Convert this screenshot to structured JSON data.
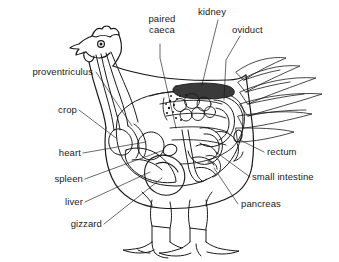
{
  "figure": {
    "background_color": "#ffffff",
    "line_color": "#1a1a1a",
    "kidney_fill": "#3a3a3a",
    "label_color": "#1a1a1a"
  },
  "labels": [
    {
      "id": "paired-caeca",
      "text_line1": "paired",
      "text_line2": "caeca",
      "text": "paired caeca",
      "side": "top",
      "x": 143,
      "y": 18
    },
    {
      "id": "kidney",
      "text": "kidney",
      "side": "top",
      "x": 200,
      "y": 8
    },
    {
      "id": "oviduct",
      "text": "oviduct",
      "side": "top",
      "x": 234,
      "y": 26
    },
    {
      "id": "proventriculus",
      "text": "proventriculus",
      "side": "left",
      "x": 19,
      "y": 69
    },
    {
      "id": "crop",
      "text": "crop",
      "side": "left",
      "x": 58,
      "y": 106
    },
    {
      "id": "heart",
      "text": "heart",
      "side": "left",
      "x": 56,
      "y": 150
    },
    {
      "id": "spleen",
      "text": "spleen",
      "side": "left",
      "x": 49,
      "y": 176
    },
    {
      "id": "liver",
      "text": "liver",
      "side": "left",
      "x": 69,
      "y": 200
    },
    {
      "id": "gizzard",
      "text": "gizzard",
      "side": "left",
      "x": 68,
      "y": 222
    },
    {
      "id": "rectum",
      "text": "rectum",
      "side": "right",
      "x": 268,
      "y": 150
    },
    {
      "id": "small-intestine",
      "text": "small intestine",
      "side": "right",
      "x": 253,
      "y": 175
    },
    {
      "id": "pancreas",
      "text": "pancreas",
      "side": "right",
      "x": 242,
      "y": 202
    }
  ]
}
